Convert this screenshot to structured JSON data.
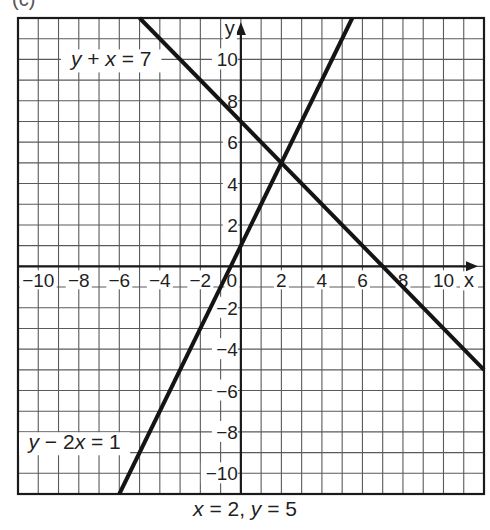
{
  "figure": {
    "part_label": "(c)",
    "caption": "x = 2, y = 5"
  },
  "chart_data": {
    "type": "line",
    "title": "",
    "xlabel": "x",
    "ylabel": "y",
    "xlim": [
      -11,
      12
    ],
    "ylim": [
      -11,
      12
    ],
    "grid": true,
    "grid_step": 1,
    "x_ticks": [
      -10,
      -8,
      -6,
      -4,
      -2,
      0,
      2,
      4,
      6,
      8,
      10
    ],
    "y_ticks": [
      -10,
      -8,
      -6,
      -4,
      -2,
      2,
      4,
      6,
      8,
      10
    ],
    "series": [
      {
        "name": "y + x = 7",
        "equation": "y = 7 - x",
        "x": [
          -5,
          12
        ],
        "y": [
          12,
          -5
        ]
      },
      {
        "name": "y - 2x = 1",
        "equation": "y = 2x + 1",
        "x": [
          -6,
          5.5
        ],
        "y": [
          -11,
          12
        ]
      }
    ],
    "annotations": [
      {
        "text": "y + x = 7",
        "at": [
          -6.5,
          10
        ]
      },
      {
        "text": "y - 2x = 1",
        "at": [
          -8.5,
          -8.5
        ]
      }
    ],
    "intersection": {
      "x": 2,
      "y": 5
    },
    "legend": "none (inline labels)"
  }
}
